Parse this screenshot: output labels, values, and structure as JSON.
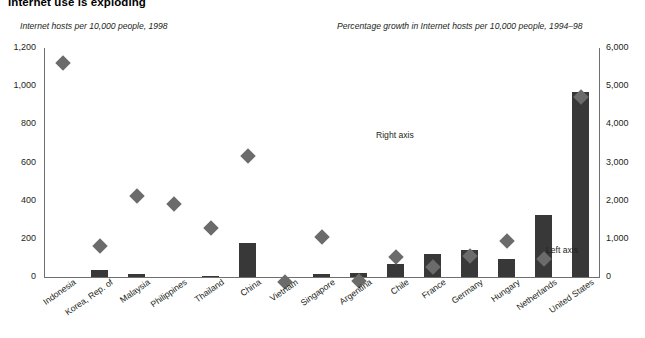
{
  "title": "Internet use is exploding",
  "axis_captions": {
    "left": "Internet hosts per 10,000 people, 1998",
    "right": "Percentage growth in Internet hosts per 10,000 people, 1994–98"
  },
  "annotations": {
    "right_axis": "Right axis",
    "left_axis": "Left axis"
  },
  "chart_data": {
    "type": "bar",
    "title": "Internet use is exploding",
    "subtitle": "",
    "xlabel": "",
    "ylabel": "Internet hosts per 10,000 people, 1998",
    "y2label": "Percentage growth in Internet hosts per 10,000 people, 1994–98",
    "ylim": [
      0,
      1200
    ],
    "y2lim": [
      0,
      6000
    ],
    "yticks": [
      "0",
      "200",
      "400",
      "600",
      "800",
      "1,000",
      "1,200"
    ],
    "ytick_values": [
      0,
      200,
      400,
      600,
      800,
      1000,
      1200
    ],
    "y2ticks": [
      "0",
      "1,000",
      "2,000",
      "3,000",
      "4,000",
      "5,000",
      "6,000"
    ],
    "y2tick_values": [
      0,
      1000,
      2000,
      3000,
      4000,
      5000,
      6000
    ],
    "grid": false,
    "legend": "none",
    "categories": [
      "Indonesia",
      "Korea, Rep. of",
      "Malaysia",
      "Philippines",
      "Thailand",
      "China",
      "Vietnam",
      "Singapore",
      "Argentina",
      "Chile",
      "France",
      "Germany",
      "Hungary",
      "Netherlands",
      "United States"
    ],
    "series": [
      {
        "name": "Percentage growth in Internet hosts per 10,000 people, 1994–98",
        "type": "bar",
        "axis": "right",
        "color": "#383838",
        "values": [
          0,
          180,
          70,
          0,
          25,
          900,
          0,
          70,
          110,
          330,
          600,
          720,
          470,
          1620,
          4850
        ]
      },
      {
        "name": "Internet hosts per 10,000 people, 1998",
        "type": "scatter",
        "marker": "diamond",
        "axis": "left",
        "color": "#6b6b6b",
        "values": [
          1150,
          190,
          455,
          410,
          285,
          665,
          5,
          240,
          10,
          135,
          80,
          140,
          220,
          125,
          970
        ]
      }
    ],
    "annotations": [
      {
        "text": "Right axis",
        "points_to": "China",
        "series": "Internet hosts per 10,000 people, 1998"
      },
      {
        "text": "Left axis",
        "points_to": "Netherlands",
        "series": "Percentage growth in Internet hosts per 10,000 people, 1994–98"
      }
    ]
  }
}
